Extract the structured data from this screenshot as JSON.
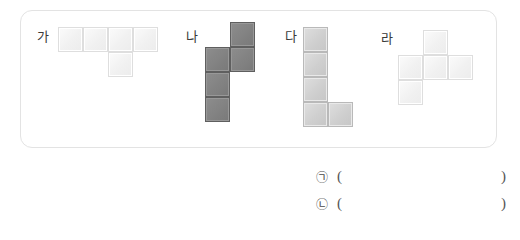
{
  "panel": {
    "name": "shape-panel",
    "border_color": "#e3e3e3"
  },
  "shapes": [
    {
      "label": "가",
      "tone": "light",
      "cells": [
        {
          "col": 0,
          "row": 0
        },
        {
          "col": 1,
          "row": 0
        },
        {
          "col": 2,
          "row": 0
        },
        {
          "col": 3,
          "row": 0
        },
        {
          "col": 2,
          "row": 1
        }
      ]
    },
    {
      "label": "나",
      "tone": "dark",
      "cells": [
        {
          "col": 1,
          "row": 0
        },
        {
          "col": 0,
          "row": 1
        },
        {
          "col": 1,
          "row": 1
        },
        {
          "col": 0,
          "row": 2
        },
        {
          "col": 0,
          "row": 3
        }
      ]
    },
    {
      "label": "다",
      "tone": "mid",
      "cells": [
        {
          "col": 0,
          "row": 0
        },
        {
          "col": 0,
          "row": 1
        },
        {
          "col": 0,
          "row": 2
        },
        {
          "col": 0,
          "row": 3
        },
        {
          "col": 1,
          "row": 3
        }
      ]
    },
    {
      "label": "라",
      "tone": "light",
      "cells": [
        {
          "col": 1,
          "row": 0
        },
        {
          "col": 0,
          "row": 1
        },
        {
          "col": 1,
          "row": 1
        },
        {
          "col": 2,
          "row": 1
        },
        {
          "col": 0,
          "row": 2
        }
      ]
    }
  ],
  "answers": [
    {
      "marker": "㉠",
      "open": "(",
      "value": "",
      "close": ")"
    },
    {
      "marker": "㉡",
      "open": "(",
      "value": "",
      "close": ")"
    }
  ]
}
